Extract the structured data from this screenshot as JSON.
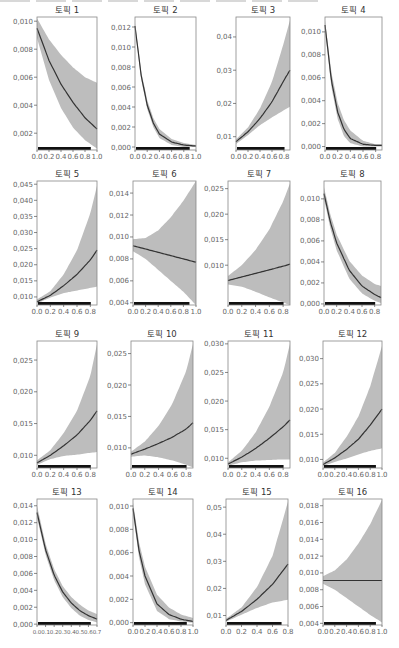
{
  "figure": {
    "caption_partial": "",
    "band_color": "#bdbdbd",
    "line_color": "#333333",
    "frame_color": "#888888",
    "rug_color": "#111111",
    "tick_color": "#555555"
  },
  "chart_data": [
    {
      "type": "line",
      "title": "토픽 1",
      "xticks": [
        "0.0",
        "0.2",
        "0.4",
        "0.6",
        "0.8",
        "1.0"
      ],
      "xlim": [
        0,
        1.0
      ],
      "ylim": [
        0.0008,
        0.0103
      ],
      "yticks": [
        0.002,
        0.004,
        0.006,
        0.008,
        0.01
      ],
      "ytick_labels": [
        "0,002",
        "0,004",
        "0,006",
        "0,008",
        "0,010"
      ],
      "x": [
        0,
        0.2,
        0.4,
        0.6,
        0.8,
        1.0
      ],
      "fit": [
        0.0095,
        0.0072,
        0.0055,
        0.0042,
        0.0031,
        0.0023
      ],
      "lower": [
        0.0088,
        0.0058,
        0.0038,
        0.0024,
        0.0015,
        0.0009
      ],
      "upper": [
        0.0102,
        0.0087,
        0.0076,
        0.0067,
        0.006,
        0.0056
      ]
    },
    {
      "type": "line",
      "title": "토픽 2",
      "xticks": [
        "0.0",
        "0.2",
        "0.4",
        "0.6",
        "0.8",
        "1.0"
      ],
      "xlim": [
        0,
        1.0
      ],
      "ylim": [
        -0.0003,
        0.013
      ],
      "yticks": [
        0,
        0.002,
        0.004,
        0.006,
        0.008,
        0.01,
        0.012
      ],
      "ytick_labels": [
        "0,000",
        "0,002",
        "0,004",
        "0,006",
        "0,008",
        "0,010",
        "0,012"
      ],
      "x": [
        0,
        0.1,
        0.2,
        0.3,
        0.4,
        0.6,
        0.8,
        1.0
      ],
      "fit": [
        0.0121,
        0.0072,
        0.0042,
        0.0024,
        0.0013,
        0.0005,
        0.0002,
        0.0001
      ],
      "lower": [
        0.0118,
        0.0068,
        0.0038,
        0.002,
        0.0009,
        0.0002,
        0.0,
        0.0
      ],
      "upper": [
        0.0124,
        0.0076,
        0.0047,
        0.0029,
        0.0018,
        0.0008,
        0.0004,
        0.0002
      ]
    },
    {
      "type": "line",
      "title": "토픽 3",
      "xticks": [
        "0.0",
        "0.2",
        "0.4",
        "0.6",
        "0.8"
      ],
      "xlim": [
        0,
        0.9
      ],
      "ylim": [
        0.006,
        0.046
      ],
      "yticks": [
        0.01,
        0.02,
        0.03,
        0.04
      ],
      "ytick_labels": [
        "0,01",
        "0,02",
        "0,03",
        "0,04"
      ],
      "x": [
        0,
        0.2,
        0.4,
        0.6,
        0.8,
        0.9
      ],
      "fit": [
        0.0085,
        0.0115,
        0.0155,
        0.0205,
        0.027,
        0.03
      ],
      "lower": [
        0.0078,
        0.0105,
        0.0135,
        0.0158,
        0.018,
        0.019
      ],
      "upper": [
        0.0092,
        0.0128,
        0.0185,
        0.0265,
        0.0385,
        0.045
      ]
    },
    {
      "type": "line",
      "title": "토픽 4",
      "xticks": [
        "0.0",
        "0.2",
        "0.4",
        "0.6",
        "0.8"
      ],
      "xlim": [
        0,
        0.9
      ],
      "ylim": [
        -0.0003,
        0.0113
      ],
      "yticks": [
        0,
        0.002,
        0.004,
        0.006,
        0.008,
        0.01
      ],
      "ytick_labels": [
        "0,000",
        "0,002",
        "0,004",
        "0,006",
        "0,008",
        "0,010"
      ],
      "x": [
        0,
        0.1,
        0.2,
        0.3,
        0.4,
        0.6,
        0.8,
        0.9
      ],
      "fit": [
        0.0106,
        0.0058,
        0.003,
        0.0015,
        0.0007,
        0.0002,
        0.0001,
        0.0001
      ],
      "lower": [
        0.0102,
        0.0052,
        0.0024,
        0.0009,
        0.0003,
        0.0,
        0.0,
        0.0
      ],
      "upper": [
        0.011,
        0.0065,
        0.0038,
        0.0023,
        0.0014,
        0.0005,
        0.0002,
        0.0002
      ]
    },
    {
      "type": "line",
      "title": "토픽 5",
      "xticks": [
        "0.0",
        "0.2",
        "0.4",
        "0.6",
        "0.8"
      ],
      "xlim": [
        0,
        0.9
      ],
      "ylim": [
        0.0075,
        0.046
      ],
      "yticks": [
        0.01,
        0.015,
        0.02,
        0.025,
        0.03,
        0.035,
        0.04,
        0.045
      ],
      "ytick_labels": [
        "0,010",
        "0,015",
        "0,020",
        "0,025",
        "0,030",
        "0,035",
        "0,040",
        "0,045"
      ],
      "x": [
        0,
        0.2,
        0.4,
        0.6,
        0.8,
        0.9
      ],
      "fit": [
        0.0085,
        0.0105,
        0.0135,
        0.017,
        0.0215,
        0.0245
      ],
      "lower": [
        0.008,
        0.0098,
        0.0112,
        0.012,
        0.0128,
        0.0132
      ],
      "upper": [
        0.0092,
        0.0118,
        0.017,
        0.0245,
        0.036,
        0.0445
      ]
    },
    {
      "type": "line",
      "title": "토픽 6",
      "xticks": [
        "0.0",
        "0.2",
        "0.4",
        "0.6",
        "0.8",
        "1.0"
      ],
      "xlim": [
        0,
        1.0
      ],
      "ylim": [
        0.0038,
        0.0151
      ],
      "yticks": [
        0.004,
        0.006,
        0.008,
        0.01,
        0.012,
        0.014
      ],
      "ytick_labels": [
        "0,004",
        "0,006",
        "0,008",
        "0,010",
        "0,012",
        "0,014"
      ],
      "x": [
        0,
        0.2,
        0.4,
        0.6,
        0.8,
        1.0
      ],
      "fit": [
        0.0092,
        0.0089,
        0.0086,
        0.0083,
        0.008,
        0.0077
      ],
      "lower": [
        0.0087,
        0.008,
        0.007,
        0.006,
        0.005,
        0.0038
      ],
      "upper": [
        0.0098,
        0.0099,
        0.0106,
        0.0118,
        0.0133,
        0.0151
      ]
    },
    {
      "type": "line",
      "title": "토픽 7",
      "xticks": [
        "0.0",
        "0.2",
        "0.4",
        "0.6",
        "0.8"
      ],
      "xlim": [
        0,
        0.9
      ],
      "ylim": [
        0.0022,
        0.0265
      ],
      "yticks": [
        0.01,
        0.015,
        0.02,
        0.025
      ],
      "ytick_labels": [
        "0,010",
        "0,015",
        "0,020",
        "0,025"
      ],
      "x": [
        0,
        0.2,
        0.4,
        0.6,
        0.8,
        0.9
      ],
      "fit": [
        0.007,
        0.0077,
        0.0084,
        0.0091,
        0.0098,
        0.0102
      ],
      "lower": [
        0.0062,
        0.0058,
        0.0048,
        0.0037,
        0.0027,
        0.0022
      ],
      "upper": [
        0.0079,
        0.01,
        0.013,
        0.017,
        0.0225,
        0.026
      ]
    },
    {
      "type": "line",
      "title": "토픽 8",
      "xticks": [
        "0.0",
        "0.2",
        "0.4",
        "0.6",
        "0.8"
      ],
      "xlim": [
        0,
        0.9
      ],
      "ylim": [
        -0.0001,
        0.0117
      ],
      "yticks": [
        0,
        0.002,
        0.004,
        0.006,
        0.008,
        0.01
      ],
      "ytick_labels": [
        "0,000",
        "0,002",
        "0,004",
        "0,006",
        "0,008",
        "0,010"
      ],
      "x": [
        0,
        0.1,
        0.2,
        0.4,
        0.6,
        0.8,
        0.9
      ],
      "fit": [
        0.0105,
        0.0078,
        0.0058,
        0.0032,
        0.0017,
        0.0009,
        0.0006
      ],
      "lower": [
        0.01,
        0.0072,
        0.0051,
        0.0024,
        0.001,
        0.0003,
        0.0001
      ],
      "upper": [
        0.0111,
        0.0085,
        0.0066,
        0.0041,
        0.0027,
        0.0019,
        0.0017
      ]
    },
    {
      "type": "line",
      "title": "토픽 9",
      "xticks": [
        "0.0",
        "0.2",
        "0.4",
        "0.6",
        "0.8"
      ],
      "xlim": [
        0,
        0.9
      ],
      "ylim": [
        0.008,
        0.028
      ],
      "yticks": [
        0.01,
        0.015,
        0.02,
        0.025
      ],
      "ytick_labels": [
        "0,010",
        "0,015",
        "0,020",
        "0,025"
      ],
      "x": [
        0,
        0.2,
        0.4,
        0.6,
        0.8,
        0.9
      ],
      "fit": [
        0.0088,
        0.01,
        0.0115,
        0.0132,
        0.0155,
        0.017
      ],
      "lower": [
        0.0085,
        0.0094,
        0.0099,
        0.0101,
        0.0104,
        0.0105
      ],
      "upper": [
        0.0092,
        0.0108,
        0.0135,
        0.017,
        0.0225,
        0.0275
      ]
    },
    {
      "type": "line",
      "title": "토픽 10",
      "xticks": [
        "0.0",
        "0.2",
        "0.4",
        "0.6",
        "0.8"
      ],
      "xlim": [
        0,
        0.9
      ],
      "ylim": [
        0.0068,
        0.027
      ],
      "yticks": [
        0.01,
        0.015,
        0.02,
        0.025
      ],
      "ytick_labels": [
        "0,010",
        "0,015",
        "0,020",
        "0,025"
      ],
      "x": [
        0,
        0.2,
        0.4,
        0.6,
        0.8,
        0.9
      ],
      "fit": [
        0.009,
        0.0098,
        0.0107,
        0.0117,
        0.013,
        0.014
      ],
      "lower": [
        0.0086,
        0.0088,
        0.0085,
        0.008,
        0.0073,
        0.0069
      ],
      "upper": [
        0.0094,
        0.011,
        0.0135,
        0.017,
        0.0222,
        0.0265
      ]
    },
    {
      "type": "line",
      "title": "토픽 11",
      "xticks": [
        "0.0",
        "0.2",
        "0.4",
        "0.6",
        "0.8"
      ],
      "xlim": [
        0,
        0.9
      ],
      "ylim": [
        0.0083,
        0.0305
      ],
      "yticks": [
        0.01,
        0.015,
        0.02,
        0.025,
        0.03
      ],
      "ytick_labels": [
        "0,010",
        "0,015",
        "0,020",
        "0,025",
        "0,030"
      ],
      "x": [
        0,
        0.2,
        0.4,
        0.6,
        0.8,
        0.9
      ],
      "fit": [
        0.009,
        0.0102,
        0.0117,
        0.0135,
        0.0155,
        0.0167
      ],
      "lower": [
        0.0087,
        0.0093,
        0.0096,
        0.0097,
        0.0098,
        0.0098
      ],
      "upper": [
        0.0093,
        0.0113,
        0.0145,
        0.019,
        0.025,
        0.03
      ]
    },
    {
      "type": "line",
      "title": "토픽 12",
      "xticks": [
        "0.0",
        "0.2",
        "0.4",
        "0.6",
        "0.8",
        "1.0"
      ],
      "xlim": [
        0,
        1.0
      ],
      "ylim": [
        0.0083,
        0.0335
      ],
      "yticks": [
        0.01,
        0.015,
        0.02,
        0.025,
        0.03
      ],
      "ytick_labels": [
        "0,010",
        "0,015",
        "0,020",
        "0,025",
        "0,030"
      ],
      "x": [
        0,
        0.2,
        0.4,
        0.6,
        0.8,
        1.0
      ],
      "fit": [
        0.009,
        0.0103,
        0.012,
        0.014,
        0.0168,
        0.02
      ],
      "lower": [
        0.0087,
        0.0095,
        0.0102,
        0.011,
        0.0117,
        0.0122
      ],
      "upper": [
        0.0094,
        0.0113,
        0.0145,
        0.0185,
        0.0245,
        0.0325
      ]
    },
    {
      "type": "line",
      "title": "토픽 13",
      "xticks": [
        "0.0",
        "0.1",
        "0.2",
        "0.3",
        "0.4",
        "0.5",
        "0.6",
        "0.7"
      ],
      "xlim": [
        0,
        0.7
      ],
      "ylim": [
        -0.0001,
        0.0148
      ],
      "yticks": [
        0,
        0.002,
        0.004,
        0.006,
        0.008,
        0.01,
        0.012,
        0.014
      ],
      "ytick_labels": [
        "0,000",
        "0,002",
        "0,004",
        "0,006",
        "0,008",
        "0,010",
        "0,012",
        "0,014"
      ],
      "x": [
        0,
        0.1,
        0.2,
        0.3,
        0.4,
        0.5,
        0.6,
        0.7
      ],
      "fit": [
        0.0132,
        0.0088,
        0.0058,
        0.0038,
        0.0025,
        0.0016,
        0.001,
        0.0006
      ],
      "lower": [
        0.0126,
        0.0082,
        0.0052,
        0.0032,
        0.0019,
        0.001,
        0.0005,
        0.0002
      ],
      "upper": [
        0.014,
        0.0095,
        0.0065,
        0.0045,
        0.0032,
        0.0023,
        0.0016,
        0.0012
      ]
    },
    {
      "type": "line",
      "title": "토픽 14",
      "xticks": [
        "0.0",
        "0.2",
        "0.4",
        "0.6",
        "0.8",
        "1.0"
      ],
      "xlim": [
        0,
        1.0
      ],
      "ylim": [
        -0.0002,
        0.0106
      ],
      "yticks": [
        0,
        0.002,
        0.004,
        0.006,
        0.008,
        0.01
      ],
      "ytick_labels": [
        "0,000",
        "0,002",
        "0,004",
        "0,006",
        "0,008",
        "0,010"
      ],
      "x": [
        0,
        0.1,
        0.2,
        0.4,
        0.6,
        0.8,
        1.0
      ],
      "fit": [
        0.0098,
        0.0062,
        0.004,
        0.0016,
        0.0007,
        0.0003,
        0.0001
      ],
      "lower": [
        0.0094,
        0.0056,
        0.0033,
        0.001,
        0.0003,
        0.0001,
        0.0
      ],
      "upper": [
        0.0103,
        0.0069,
        0.0048,
        0.0024,
        0.0013,
        0.0007,
        0.0004
      ]
    },
    {
      "type": "line",
      "title": "토픽 15",
      "xticks": [
        "0.0",
        "0.2",
        "0.4",
        "0.6",
        "0.8"
      ],
      "xlim": [
        0,
        0.8
      ],
      "ylim": [
        0.0065,
        0.053
      ],
      "yticks": [
        0.01,
        0.02,
        0.03,
        0.04,
        0.05
      ],
      "ytick_labels": [
        "0,01",
        "0,02",
        "0,03",
        "0,04",
        "0,05"
      ],
      "x": [
        0,
        0.2,
        0.4,
        0.6,
        0.8
      ],
      "fit": [
        0.0082,
        0.0115,
        0.016,
        0.0215,
        0.029
      ],
      "lower": [
        0.0077,
        0.0103,
        0.0128,
        0.0148,
        0.0158
      ],
      "upper": [
        0.0088,
        0.013,
        0.0205,
        0.032,
        0.052
      ]
    },
    {
      "type": "line",
      "title": "토픽 16",
      "xticks": [
        "0.0",
        "0.2",
        "0.4",
        "0.6",
        "0.8",
        "1.0"
      ],
      "xlim": [
        0,
        1.0
      ],
      "ylim": [
        0.0038,
        0.0188
      ],
      "yticks": [
        0.004,
        0.006,
        0.008,
        0.01,
        0.012,
        0.014,
        0.016,
        0.018
      ],
      "ytick_labels": [
        "0,004",
        "0,006",
        "0,008",
        "0,010",
        "0,012",
        "0,014",
        "0,016",
        "0,018"
      ],
      "x": [
        0,
        0.2,
        0.4,
        0.6,
        0.8,
        1.0
      ],
      "fit": [
        0.0091,
        0.0091,
        0.0091,
        0.0091,
        0.0091,
        0.0091
      ],
      "lower": [
        0.0087,
        0.008,
        0.007,
        0.006,
        0.005,
        0.0041
      ],
      "upper": [
        0.0096,
        0.0103,
        0.0116,
        0.0135,
        0.0158,
        0.0187
      ]
    }
  ]
}
